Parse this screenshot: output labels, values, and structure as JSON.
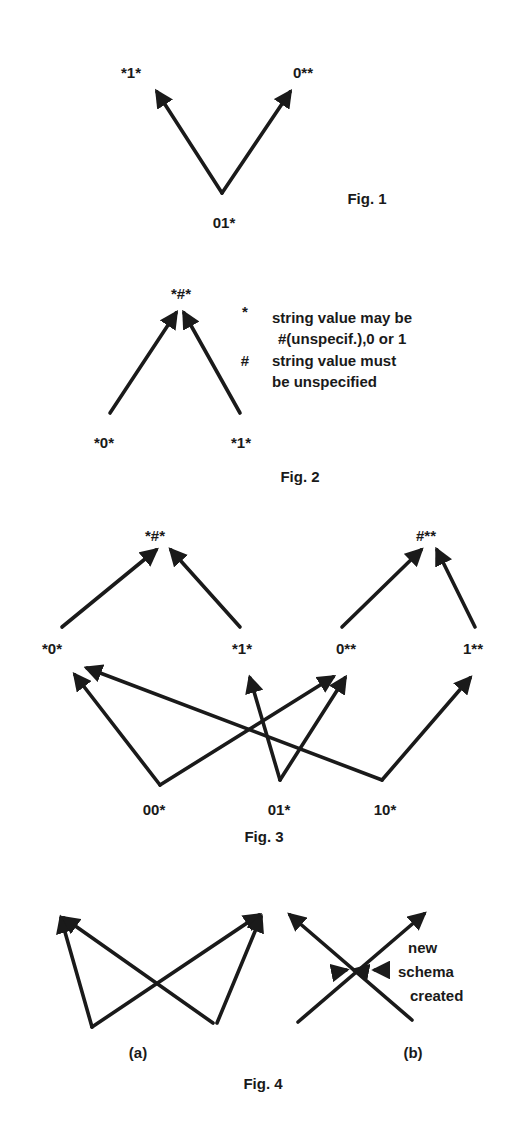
{
  "figures": {
    "fig1": {
      "caption": "Fig. 1",
      "nodes": {
        "left": "*1*",
        "right": "0**",
        "bottom": "01*"
      }
    },
    "fig2": {
      "caption": "Fig. 2",
      "nodes": {
        "top": "*#*",
        "left": "*0*",
        "right": "*1*"
      },
      "legend": [
        {
          "symbol": "*",
          "text_line1": "string value may be",
          "text_line2": "#(unspecif.),0 or 1"
        },
        {
          "symbol": "#",
          "text_line1": "string value must",
          "text_line2": "be unspecified"
        }
      ]
    },
    "fig3": {
      "caption": "Fig. 3",
      "top_nodes": [
        "*#*",
        "#**"
      ],
      "middle_nodes": [
        "*0*",
        "*1*",
        "0**",
        "1**"
      ],
      "bottom_nodes": [
        "00*",
        "01*",
        "10*"
      ]
    },
    "fig4": {
      "caption": "Fig. 4",
      "sub_a": "(a)",
      "sub_b": "(b)",
      "note": [
        "new",
        "schema",
        "created"
      ]
    }
  },
  "colors": {
    "ink": "#1a1a1a",
    "background": "#ffffff"
  }
}
